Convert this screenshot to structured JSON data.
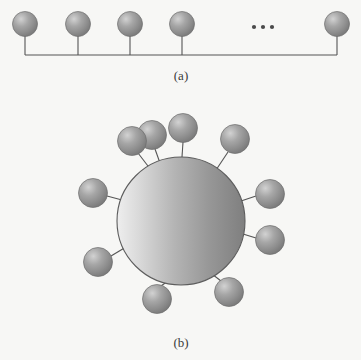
{
  "figure": {
    "background_color": "#f7f7f5",
    "line_color": "#555555",
    "sphere_base_color": "#8e8e8e",
    "sphere_highlight_color": "#cfcfcf",
    "sphere_shadow_color": "#6e6e6e",
    "caption_color": "#3b3b3b"
  },
  "panels": [
    {
      "id": "panel-a",
      "caption": "(a)",
      "caption_x": 181,
      "caption_y": 80,
      "backbone": {
        "x1": 25,
        "x2": 337,
        "y": 55,
        "stroke_width": 1.2
      },
      "ellipsis": {
        "label": "...",
        "dots": [
          {
            "cx": 254,
            "cy": 27,
            "r": 2.1
          },
          {
            "cx": 263,
            "cy": 27,
            "r": 2.1
          },
          {
            "cx": 272,
            "cy": 27,
            "r": 2.1
          }
        ]
      },
      "units": [
        {
          "index": 1,
          "cx": 25,
          "cy": 24,
          "r": 12.5,
          "stem_y2": 55
        },
        {
          "index": 2,
          "cx": 78,
          "cy": 24,
          "r": 12.5,
          "stem_y2": 55
        },
        {
          "index": 3,
          "cx": 130,
          "cy": 24,
          "r": 12.5,
          "stem_y2": 55
        },
        {
          "index": 4,
          "cx": 182,
          "cy": 24,
          "r": 12.5,
          "stem_y2": 55
        },
        {
          "index": 5,
          "cx": 337,
          "cy": 24,
          "r": 12.5,
          "stem_y2": 55
        }
      ]
    },
    {
      "id": "panel-b",
      "caption": "(b)",
      "caption_x": 181,
      "caption_y": 347,
      "core": {
        "cx": 181,
        "cy": 221,
        "r": 64,
        "stroke_width": 1.1
      },
      "satellites": [
        {
          "index": 1,
          "cx": 183,
          "cy": 128,
          "r": 14.5,
          "link_x1": 182,
          "link_y1": 157,
          "link_x2": 183,
          "link_y2": 142
        },
        {
          "index": 2,
          "cx": 132,
          "cy": 141,
          "r": 14.5,
          "link_x1": 151,
          "link_y1": 170,
          "link_x2": 138,
          "link_y2": 153
        },
        {
          "index": 3,
          "cx": 235,
          "cy": 139,
          "r": 14.5,
          "link_x1": 216,
          "link_y1": 170,
          "link_x2": 228,
          "link_y2": 152
        },
        {
          "index": 4,
          "cx": 93,
          "cy": 193,
          "r": 14.5,
          "link_x1": 122,
          "link_y1": 200,
          "link_x2": 107,
          "link_y2": 196
        },
        {
          "index": 5,
          "cx": 270,
          "cy": 194,
          "r": 14.5,
          "link_x1": 241,
          "link_y1": 201,
          "link_x2": 256,
          "link_y2": 196
        },
        {
          "index": 6,
          "cx": 270,
          "cy": 240,
          "r": 14.5,
          "link_x1": 243,
          "link_y1": 234,
          "link_x2": 256,
          "link_y2": 238
        },
        {
          "index": 7,
          "cx": 98,
          "cy": 262,
          "r": 14.5,
          "link_x1": 126,
          "link_y1": 247,
          "link_x2": 111,
          "link_y2": 256
        },
        {
          "index": 8,
          "cx": 157,
          "cy": 299,
          "r": 14.5,
          "link_x1": 168,
          "link_y1": 281,
          "link_x2": 161,
          "link_y2": 286
        },
        {
          "index": 9,
          "cx": 229,
          "cy": 292,
          "r": 14.5,
          "link_x1": 212,
          "link_y1": 274,
          "link_x2": 221,
          "link_y2": 281
        },
        {
          "index": 10,
          "cx": 152,
          "cy": 135,
          "r": 14.5,
          "link_x1": 160,
          "link_y1": 163,
          "link_x2": 155,
          "link_y2": 149
        }
      ]
    }
  ]
}
